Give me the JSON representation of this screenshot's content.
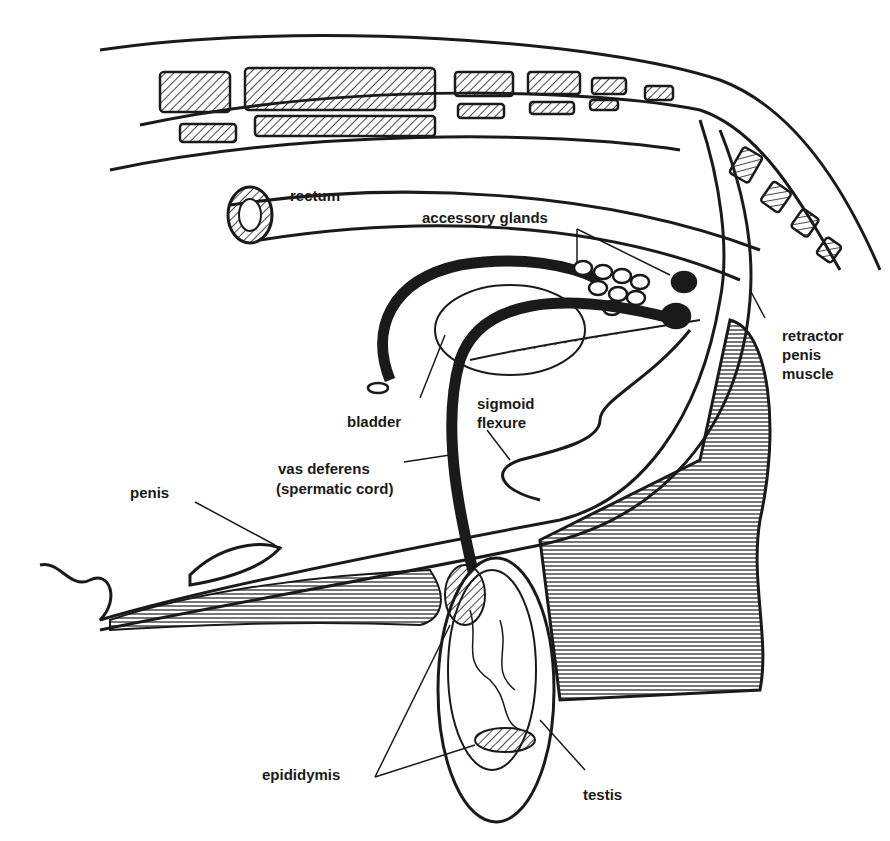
{
  "diagram": {
    "labels": {
      "rectum": "rectum",
      "accessory_glands": "accessory glands",
      "retractor_1": "retractor",
      "retractor_2": "penis",
      "retractor_3": "muscle",
      "bladder": "bladder",
      "sigmoid_1": "sigmoid",
      "sigmoid_2": "flexure",
      "vas_1": "vas deferens",
      "vas_2": "(spermatic cord)",
      "penis": "penis",
      "epididymis": "epididymis",
      "testis": "testis"
    },
    "colors": {
      "ink": "#1a1a1a",
      "background": "#ffffff"
    }
  }
}
